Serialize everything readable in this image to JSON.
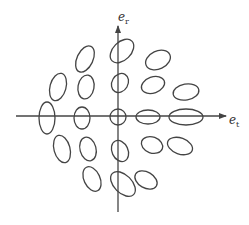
{
  "diagram": {
    "axes": {
      "horizontal_label": "e",
      "horizontal_subscript": "t",
      "vertical_label": "e",
      "vertical_subscript": "r",
      "origin": [
        118,
        116
      ],
      "x_range": [
        16,
        226
      ],
      "y_range": [
        26,
        212
      ]
    },
    "style": {
      "stroke": "#444444",
      "background": "#ffffff"
    },
    "ellipses": [
      {
        "cx": 85,
        "cy": 59,
        "rx": 8,
        "ry": 14,
        "rot": 25
      },
      {
        "cx": 122,
        "cy": 51,
        "rx": 9,
        "ry": 14,
        "rot": 45
      },
      {
        "cx": 158,
        "cy": 60,
        "rx": 9,
        "ry": 13,
        "rot": 65
      },
      {
        "cx": 58,
        "cy": 87,
        "rx": 8,
        "ry": 14,
        "rot": 15
      },
      {
        "cx": 86,
        "cy": 87,
        "rx": 8,
        "ry": 12,
        "rot": 10
      },
      {
        "cx": 120,
        "cy": 83,
        "rx": 8,
        "ry": 10,
        "rot": 30
      },
      {
        "cx": 153,
        "cy": 85,
        "rx": 8,
        "ry": 12,
        "rot": 70
      },
      {
        "cx": 186,
        "cy": 92,
        "rx": 8,
        "ry": 13,
        "rot": 80
      },
      {
        "cx": 47,
        "cy": 118,
        "rx": 8,
        "ry": 16,
        "rot": 0
      },
      {
        "cx": 82,
        "cy": 118,
        "rx": 8,
        "ry": 11,
        "rot": 0
      },
      {
        "cx": 118,
        "cy": 117,
        "rx": 8,
        "ry": 8,
        "rot": 0
      },
      {
        "cx": 148,
        "cy": 117,
        "rx": 7,
        "ry": 12,
        "rot": 90
      },
      {
        "cx": 186,
        "cy": 117,
        "rx": 8,
        "ry": 17,
        "rot": 90
      },
      {
        "cx": 62,
        "cy": 149,
        "rx": 8,
        "ry": 14,
        "rot": -15
      },
      {
        "cx": 88,
        "cy": 149,
        "rx": 8,
        "ry": 12,
        "rot": -15
      },
      {
        "cx": 120,
        "cy": 151,
        "rx": 8,
        "ry": 11,
        "rot": -25
      },
      {
        "cx": 152,
        "cy": 145,
        "rx": 8,
        "ry": 11,
        "rot": -70
      },
      {
        "cx": 180,
        "cy": 146,
        "rx": 8,
        "ry": 13,
        "rot": -70
      },
      {
        "cx": 92,
        "cy": 179,
        "rx": 8,
        "ry": 13,
        "rot": -25
      },
      {
        "cx": 123,
        "cy": 184,
        "rx": 9,
        "ry": 15,
        "rot": -45
      },
      {
        "cx": 146,
        "cy": 180,
        "rx": 8,
        "ry": 12,
        "rot": -60
      }
    ]
  }
}
